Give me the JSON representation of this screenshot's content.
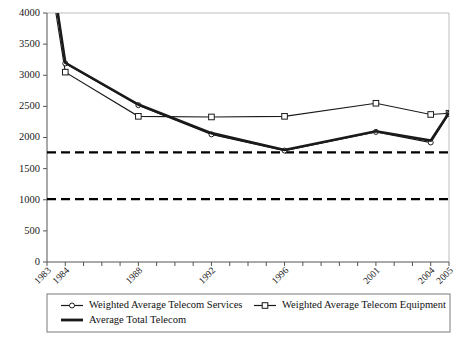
{
  "chart_data": {
    "type": "line",
    "title": "",
    "xlabel": "",
    "ylabel": "",
    "ylim": [
      0,
      4000
    ],
    "ytick_step": 500,
    "ytick_labels": [
      "0",
      "500",
      "1000",
      "1500",
      "2000",
      "2500",
      "3000",
      "3500",
      "4000"
    ],
    "grid": false,
    "legend_position": "bottom",
    "x": [
      1983,
      1984,
      1988,
      1992,
      1996,
      2001,
      2004,
      2005
    ],
    "xtick_labels": [
      "1983",
      "1984",
      "1988",
      "1992",
      "1996",
      "2001",
      "2004",
      "2005"
    ],
    "xtick_all_years": [
      1983,
      1984,
      1985,
      1986,
      1987,
      1988,
      1989,
      1990,
      1991,
      1992,
      1993,
      1994,
      1995,
      1996,
      1997,
      1998,
      1999,
      2000,
      2001,
      2002,
      2003,
      2004,
      2005
    ],
    "series": [
      {
        "name": "Weighted Average Telecom Services",
        "marker": "circle",
        "values": [
          5200,
          3190,
          2520,
          2050,
          1790,
          2090,
          1920,
          2380
        ]
      },
      {
        "name": "Weighted Average Telecom Equipment",
        "marker": "square",
        "values": [
          4900,
          3050,
          2340,
          2330,
          2340,
          2550,
          2370,
          2390
        ]
      },
      {
        "name": "Average Total Telecom",
        "marker": "none",
        "values": [
          5150,
          3200,
          2530,
          2070,
          1800,
          2100,
          1950,
          2400
        ]
      }
    ],
    "reference_lines": [
      {
        "name": "upper-reference-line",
        "value": 1760,
        "style": "dashed"
      },
      {
        "name": "lower-reference-line",
        "value": 1010,
        "style": "dashed"
      }
    ]
  },
  "legend": {
    "items": [
      {
        "label": "Weighted Average Telecom Services",
        "marker": "circle"
      },
      {
        "label": "Weighted Average Telecom Equipment",
        "marker": "square"
      },
      {
        "label": "Average Total Telecom",
        "marker": "none"
      }
    ]
  },
  "colors": {
    "line": "#1a1a1a",
    "axis": "#555555",
    "frame": "#bdbdbd",
    "reference": "#000000",
    "legend_border": "#7a7a7a",
    "background": "#ffffff"
  }
}
